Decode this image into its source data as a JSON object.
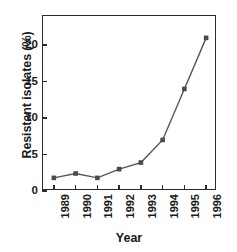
{
  "chart_data": {
    "type": "line",
    "title": "",
    "xlabel": "Year",
    "ylabel": "Resistant isolates (%)",
    "categories": [
      "1989",
      "1990",
      "1991",
      "1992",
      "1993",
      "1994",
      "1995",
      "1996"
    ],
    "values": [
      1.8,
      2.4,
      1.8,
      3.0,
      3.9,
      7.0,
      14.0,
      21.0
    ],
    "series": [
      {
        "name": "Resistant isolates",
        "values": [
          1.8,
          2.4,
          1.8,
          3.0,
          3.9,
          7.0,
          14.0,
          21.0
        ],
        "color": "#555555",
        "marker": "square"
      }
    ],
    "ylim": [
      0,
      24
    ],
    "yticks": [
      0,
      5,
      10,
      15,
      20
    ],
    "ytick_labels": [
      "0",
      "5",
      "10",
      "15",
      "20"
    ],
    "xtick_labels": [
      "1989",
      "1990",
      "1991",
      "1992",
      "1993",
      "1994",
      "1995",
      "1996"
    ],
    "grid": false,
    "legend": false,
    "line_color": "#555555",
    "marker_color": "#4a4a4a",
    "axis_color": "#2b2b2b"
  }
}
